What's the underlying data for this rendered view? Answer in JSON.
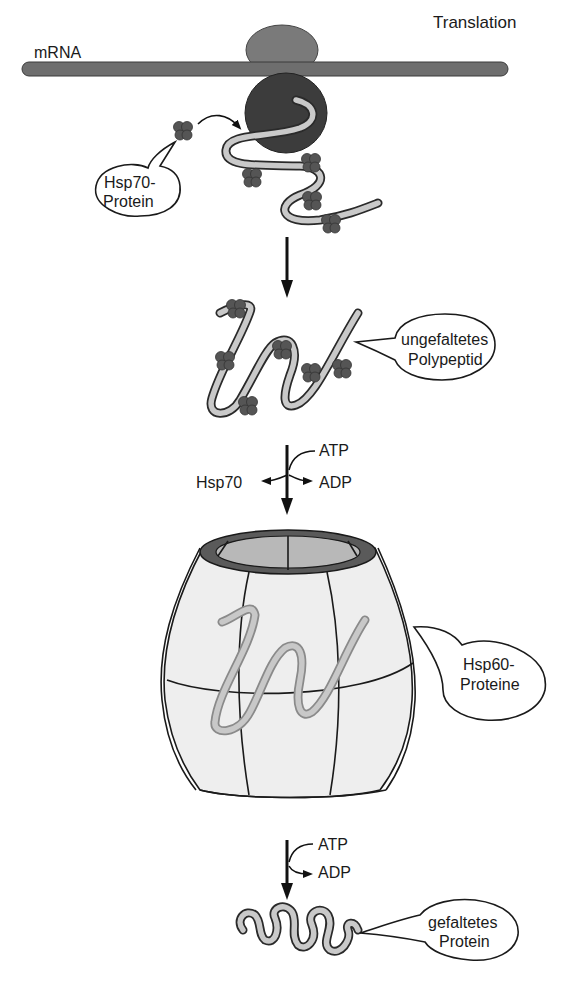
{
  "title": "Translation",
  "labels": {
    "mrna": "mRNA",
    "translation": "Translation",
    "hsp70_protein_line1": "Hsp70-",
    "hsp70_protein_line2": "Protein",
    "unfolded_line1": "ungefaltetes",
    "unfolded_line2": "Polypeptid",
    "step1_atp": "ATP",
    "step1_hsp70": "Hsp70",
    "step1_adp": "ADP",
    "hsp60_line1": "Hsp60-",
    "hsp60_line2": "Proteine",
    "step2_atp": "ATP",
    "step2_adp": "ADP",
    "folded_line1": "gefaltetes",
    "folded_line2": "Protein"
  },
  "colors": {
    "mrna": "#6e6e6e",
    "ribosome_small": "#7a7a7a",
    "ribosome_large": "#3c3c3c",
    "polypeptide_fill": "#c9c9c9",
    "hsp70": "#555555",
    "barrel_body": "#eeeeee",
    "barrel_rim": "#5a5a5a",
    "barrel_inner": "#b8b8b8"
  }
}
